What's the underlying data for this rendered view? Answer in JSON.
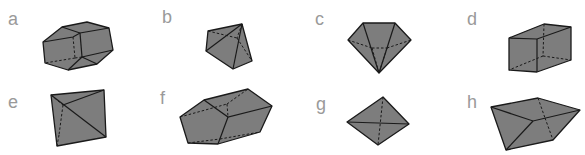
{
  "figure": {
    "panels": [
      {
        "label": "a",
        "shape": "truncated-elongated-polyhedron"
      },
      {
        "label": "b",
        "shape": "pyramid-like-polyhedron"
      },
      {
        "label": "c",
        "shape": "diamond-polyhedron"
      },
      {
        "label": "d",
        "shape": "rectangular-prism"
      },
      {
        "label": "e",
        "shape": "tetrahedron"
      },
      {
        "label": "f",
        "shape": "pentagonal-prism"
      },
      {
        "label": "g",
        "shape": "octahedron-like-bipyramid"
      },
      {
        "label": "h",
        "shape": "irregular-polyhedron"
      }
    ],
    "colors": {
      "fill": "#7d7d7d",
      "stroke": "#1a1a1a",
      "label": "#9a9a9a"
    }
  }
}
